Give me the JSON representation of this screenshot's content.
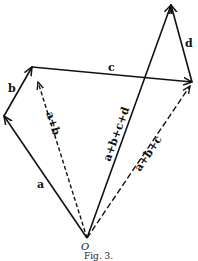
{
  "figure": {
    "caption": "Fig. 3.",
    "origin_label": "O",
    "vectors": [
      {
        "name": "a",
        "label": "a",
        "style": "solid"
      },
      {
        "name": "b",
        "label": "b",
        "style": "solid"
      },
      {
        "name": "c",
        "label": "c",
        "style": "solid"
      },
      {
        "name": "d",
        "label": "d",
        "style": "solid"
      },
      {
        "name": "a+b",
        "label": "a+b",
        "style": "dashed"
      },
      {
        "name": "a+b+c",
        "label": "a+b+c",
        "style": "dashed"
      },
      {
        "name": "a+b+c+d",
        "label": "a+b+c+d",
        "style": "solid"
      }
    ]
  }
}
